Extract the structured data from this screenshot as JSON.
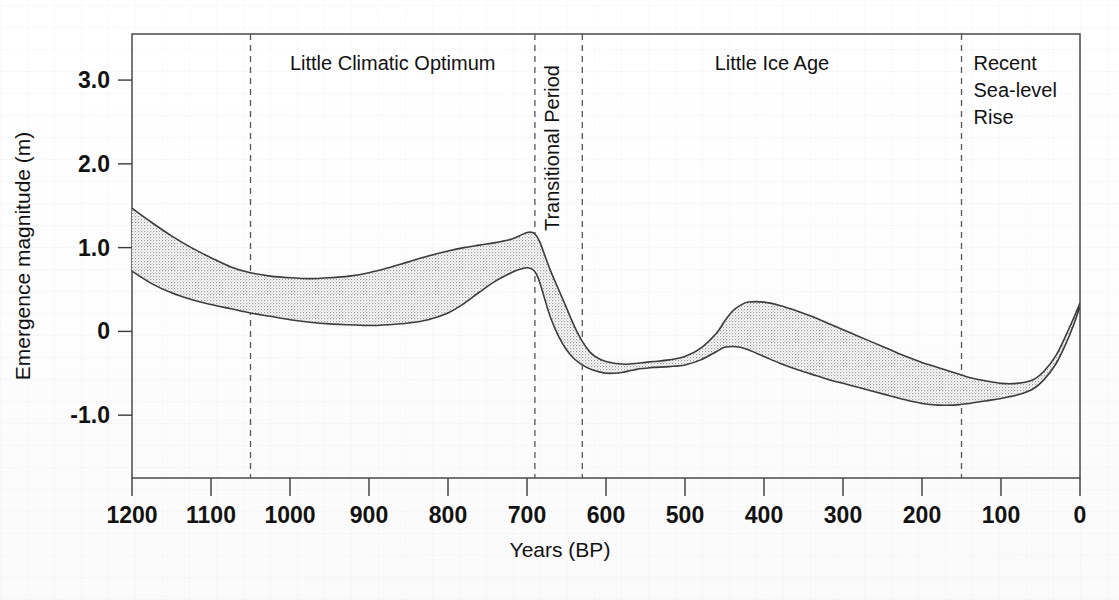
{
  "figure": {
    "title": "",
    "background_color": "#ffffff",
    "band_fill_color": "#d9d9d9",
    "band_outline_color": "#3c3c3c",
    "divider_color": "#555555"
  },
  "axes": {
    "x": {
      "label": "Years (BP)",
      "ticks": [
        "1200",
        "1100",
        "1000",
        "900",
        "800",
        "700",
        "600",
        "500",
        "400",
        "300",
        "200",
        "100",
        "0"
      ],
      "min": 0,
      "max": 1200,
      "reversed": true
    },
    "y": {
      "label": "Emergence magnitude (m)",
      "ticks": [
        "3.0",
        "2.0",
        "1.0",
        "0",
        "-1.0"
      ],
      "min": -1.75,
      "max": 3.55
    }
  },
  "periods": [
    {
      "name": "little-climatic-optimum",
      "label": "Little Climatic Optimum",
      "start_bp": 1050,
      "end_bp": 690,
      "orientation": "horizontal"
    },
    {
      "name": "transitional-period",
      "label": "Transitional Period",
      "start_bp": 690,
      "end_bp": 630,
      "orientation": "vertical"
    },
    {
      "name": "little-ice-age",
      "label": "Little Ice Age",
      "start_bp": 630,
      "end_bp": 150,
      "orientation": "horizontal"
    },
    {
      "name": "recent-sea-level-rise",
      "label": "Recent\nSea-level\nRise",
      "label_lines": [
        "Recent",
        "Sea-level",
        "Rise"
      ],
      "start_bp": 150,
      "end_bp": 0,
      "orientation": "horizontal"
    }
  ],
  "dividers_bp": [
    1050,
    690,
    630,
    150
  ],
  "chart_data": {
    "type": "area",
    "title": "",
    "xlabel": "Years (BP)",
    "ylabel": "Emergence magnitude (m)",
    "xlim": [
      1200,
      0
    ],
    "ylim": [
      -1.75,
      3.55
    ],
    "grid": false,
    "legend": "none",
    "band_description": "Stippled uncertainty envelope bounded by an upper and a lower curve; the band is drawn as a single filled region with a thin dark outline.",
    "x": [
      1200,
      1175,
      1150,
      1125,
      1100,
      1075,
      1050,
      1025,
      1000,
      975,
      950,
      925,
      900,
      875,
      850,
      825,
      800,
      780,
      760,
      740,
      720,
      710,
      700,
      693,
      688,
      683,
      678,
      670,
      660,
      650,
      640,
      630,
      620,
      610,
      600,
      590,
      580,
      570,
      560,
      550,
      540,
      520,
      500,
      480,
      460,
      450,
      440,
      430,
      420,
      400,
      380,
      360,
      340,
      320,
      300,
      280,
      260,
      240,
      220,
      200,
      180,
      160,
      150,
      140,
      120,
      100,
      80,
      60,
      45,
      30,
      18,
      8,
      0
    ],
    "series": [
      {
        "name": "upper bound",
        "values": [
          1.47,
          1.3,
          1.14,
          1.0,
          0.88,
          0.77,
          0.7,
          0.66,
          0.64,
          0.63,
          0.64,
          0.66,
          0.7,
          0.76,
          0.83,
          0.9,
          0.96,
          1.0,
          1.03,
          1.06,
          1.1,
          1.14,
          1.18,
          1.18,
          1.14,
          1.05,
          0.92,
          0.72,
          0.5,
          0.28,
          0.06,
          -0.12,
          -0.25,
          -0.32,
          -0.36,
          -0.38,
          -0.39,
          -0.39,
          -0.38,
          -0.37,
          -0.36,
          -0.34,
          -0.3,
          -0.2,
          -0.02,
          0.12,
          0.24,
          0.31,
          0.35,
          0.35,
          0.31,
          0.25,
          0.18,
          0.1,
          0.02,
          -0.06,
          -0.14,
          -0.22,
          -0.3,
          -0.37,
          -0.43,
          -0.49,
          -0.52,
          -0.55,
          -0.59,
          -0.62,
          -0.62,
          -0.58,
          -0.47,
          -0.28,
          -0.05,
          0.16,
          0.34
        ]
      },
      {
        "name": "lower bound",
        "values": [
          0.72,
          0.57,
          0.46,
          0.38,
          0.32,
          0.27,
          0.22,
          0.18,
          0.14,
          0.11,
          0.09,
          0.08,
          0.07,
          0.08,
          0.1,
          0.14,
          0.22,
          0.33,
          0.47,
          0.6,
          0.7,
          0.74,
          0.76,
          0.74,
          0.68,
          0.56,
          0.4,
          0.16,
          -0.06,
          -0.22,
          -0.33,
          -0.4,
          -0.45,
          -0.48,
          -0.5,
          -0.5,
          -0.49,
          -0.47,
          -0.45,
          -0.44,
          -0.43,
          -0.42,
          -0.4,
          -0.34,
          -0.24,
          -0.19,
          -0.18,
          -0.19,
          -0.22,
          -0.3,
          -0.38,
          -0.45,
          -0.51,
          -0.57,
          -0.62,
          -0.67,
          -0.72,
          -0.77,
          -0.82,
          -0.86,
          -0.88,
          -0.88,
          -0.87,
          -0.86,
          -0.83,
          -0.8,
          -0.76,
          -0.69,
          -0.57,
          -0.38,
          -0.15,
          0.08,
          0.3
        ]
      }
    ]
  }
}
